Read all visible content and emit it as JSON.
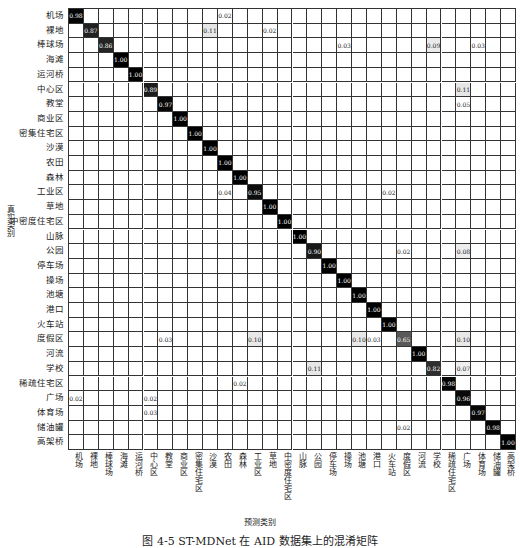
{
  "chart_data": {
    "type": "heatmap",
    "title": "",
    "xlabel": "预测类别",
    "ylabel": "真实类别",
    "caption": "图 4-5  ST-MDNet 在 AID 数据集上的混淆矩阵",
    "labels": [
      "机场",
      "裸地",
      "棒球场",
      "海滩",
      "运河桥",
      "中心区",
      "教堂",
      "商业区",
      "密集住宅区",
      "沙漠",
      "农田",
      "森林",
      "工业区",
      "草地",
      "中密度住宅区",
      "山脉",
      "公园",
      "停车场",
      "操场",
      "池塘",
      "港口",
      "火车站",
      "度假区",
      "河流",
      "学校",
      "稀疏住宅区",
      "广场",
      "体育场",
      "储油罐",
      "高架桥"
    ],
    "diagonal": [
      0.98,
      0.87,
      0.86,
      1.0,
      1.0,
      0.89,
      0.97,
      1.0,
      1.0,
      1.0,
      1.0,
      1.0,
      0.95,
      1.0,
      1.0,
      1.0,
      0.9,
      1.0,
      1.0,
      1.0,
      1.0,
      1.0,
      0.65,
      1.0,
      0.82,
      0.98,
      0.96,
      0.97,
      0.98,
      1.0
    ],
    "off_diagonal": [
      {
        "row": 0,
        "col": 10,
        "value": 0.02
      },
      {
        "row": 1,
        "col": 9,
        "value": 0.11
      },
      {
        "row": 1,
        "col": 13,
        "value": 0.02
      },
      {
        "row": 2,
        "col": 18,
        "value": 0.03
      },
      {
        "row": 2,
        "col": 24,
        "value": 0.09
      },
      {
        "row": 2,
        "col": 27,
        "value": 0.03
      },
      {
        "row": 5,
        "col": 26,
        "value": 0.11
      },
      {
        "row": 6,
        "col": 26,
        "value": 0.05
      },
      {
        "row": 12,
        "col": 10,
        "value": 0.04
      },
      {
        "row": 12,
        "col": 21,
        "value": 0.02
      },
      {
        "row": 16,
        "col": 22,
        "value": 0.02
      },
      {
        "row": 16,
        "col": 26,
        "value": 0.08
      },
      {
        "row": 22,
        "col": 6,
        "value": 0.03
      },
      {
        "row": 22,
        "col": 12,
        "value": 0.1
      },
      {
        "row": 22,
        "col": 19,
        "value": 0.1
      },
      {
        "row": 22,
        "col": 20,
        "value": 0.03
      },
      {
        "row": 22,
        "col": 26,
        "value": 0.1
      },
      {
        "row": 24,
        "col": 16,
        "value": 0.11
      },
      {
        "row": 24,
        "col": 26,
        "value": 0.07
      },
      {
        "row": 25,
        "col": 11,
        "value": 0.02
      },
      {
        "row": 26,
        "col": 0,
        "value": 0.02
      },
      {
        "row": 26,
        "col": 5,
        "value": 0.02
      },
      {
        "row": 27,
        "col": 5,
        "value": 0.03
      },
      {
        "row": 28,
        "col": 22,
        "value": 0.02
      }
    ],
    "colormap": "white-to-black",
    "grid": true
  }
}
